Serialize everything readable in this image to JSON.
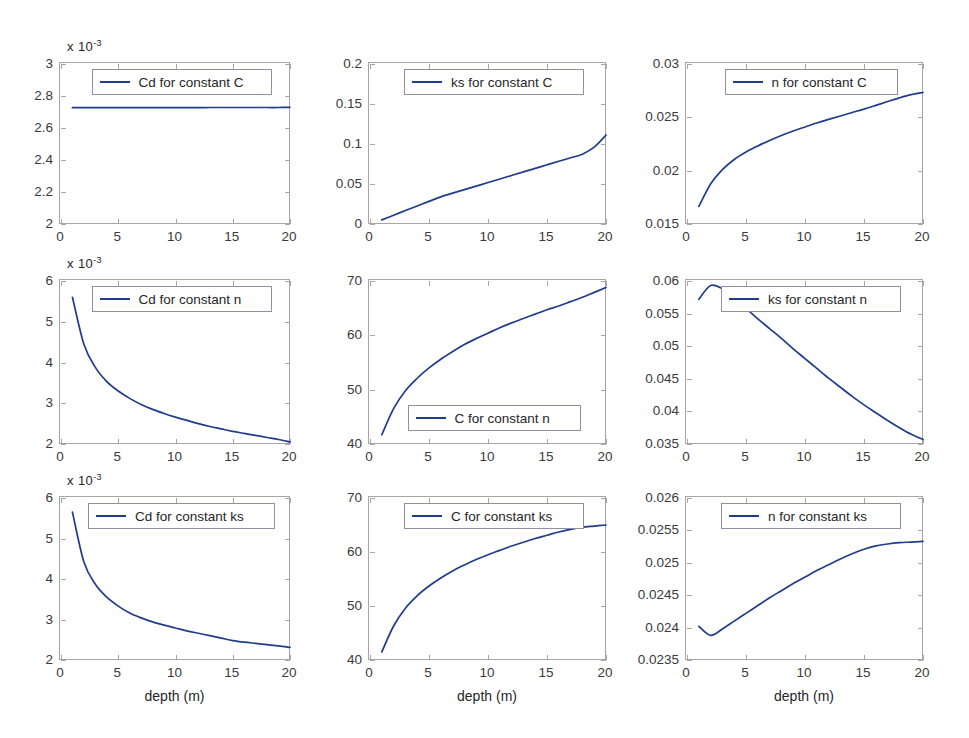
{
  "figure": {
    "width": 969,
    "height": 738,
    "background": "#ffffff",
    "line_color": "#203c8c",
    "axis_color": "#a6a6a6",
    "rows": 3,
    "cols": 3
  },
  "chart_data": [
    {
      "type": "line",
      "title": "",
      "legend": "Cd for constant C",
      "legend_position": "top-center",
      "xlabel": "",
      "ylabel": "",
      "exponent_label": "x 10",
      "exponent_power": "-3",
      "xlim": [
        0,
        20
      ],
      "ylim": [
        2,
        3
      ],
      "xticks": [
        "0",
        "5",
        "10",
        "15",
        "20"
      ],
      "xtick_values": [
        0,
        5,
        10,
        15,
        20
      ],
      "yticks": [
        "2",
        "2.2",
        "2.4",
        "2.6",
        "2.8",
        "3"
      ],
      "ytick_values": [
        2,
        2.2,
        2.4,
        2.6,
        2.8,
        3
      ],
      "grid": false,
      "x": [
        1,
        2,
        3,
        4,
        5,
        6,
        7,
        8,
        9,
        10,
        11,
        12,
        13,
        14,
        15,
        16,
        17,
        18,
        19,
        20
      ],
      "y": [
        2.727,
        2.727,
        2.727,
        2.727,
        2.727,
        2.727,
        2.727,
        2.727,
        2.727,
        2.727,
        2.727,
        2.727,
        2.728,
        2.728,
        2.728,
        2.728,
        2.728,
        2.728,
        2.728,
        2.729
      ]
    },
    {
      "type": "line",
      "title": "",
      "legend": "ks for constant C",
      "legend_position": "top-center",
      "xlabel": "",
      "ylabel": "",
      "exponent_label": "",
      "exponent_power": "",
      "xlim": [
        0,
        20
      ],
      "ylim": [
        0,
        0.2
      ],
      "xticks": [
        "0",
        "5",
        "10",
        "15",
        "20"
      ],
      "xtick_values": [
        0,
        5,
        10,
        15,
        20
      ],
      "yticks": [
        "0",
        "0.05",
        "0.1",
        "0.15",
        "0.2"
      ],
      "ytick_values": [
        0,
        0.05,
        0.1,
        0.15,
        0.2
      ],
      "grid": false,
      "x": [
        1,
        2,
        3,
        4,
        5,
        6,
        7,
        8,
        9,
        10,
        11,
        12,
        13,
        14,
        15,
        16,
        17,
        18,
        19,
        20
      ],
      "y": [
        0.0052,
        0.011,
        0.0168,
        0.0226,
        0.0283,
        0.0339,
        0.0386,
        0.043,
        0.0474,
        0.0518,
        0.0562,
        0.0607,
        0.0651,
        0.0695,
        0.074,
        0.0784,
        0.0828,
        0.0873,
        0.096,
        0.111
      ]
    },
    {
      "type": "line",
      "title": "",
      "legend": "n for constant C",
      "legend_position": "top-center",
      "xlabel": "",
      "ylabel": "",
      "exponent_label": "",
      "exponent_power": "",
      "xlim": [
        0,
        20
      ],
      "ylim": [
        0.015,
        0.03
      ],
      "xticks": [
        "0",
        "5",
        "10",
        "15",
        "20"
      ],
      "xtick_values": [
        0,
        5,
        10,
        15,
        20
      ],
      "yticks": [
        "0.015",
        "0.02",
        "0.025",
        "0.03"
      ],
      "ytick_values": [
        0.015,
        0.02,
        0.025,
        0.03
      ],
      "grid": false,
      "x": [
        1,
        2,
        3,
        4,
        5,
        6,
        7,
        8,
        9,
        10,
        11,
        12,
        13,
        14,
        15,
        16,
        17,
        18,
        19,
        20
      ],
      "y": [
        0.01665,
        0.01875,
        0.0201,
        0.02105,
        0.02175,
        0.02232,
        0.02283,
        0.0233,
        0.02372,
        0.0241,
        0.02447,
        0.02481,
        0.02513,
        0.02545,
        0.02577,
        0.02612,
        0.02648,
        0.02683,
        0.02713,
        0.02733
      ]
    },
    {
      "type": "line",
      "title": "",
      "legend": "Cd for constant n",
      "legend_position": "top-center",
      "xlabel": "",
      "ylabel": "",
      "exponent_label": "x 10",
      "exponent_power": "-3",
      "xlim": [
        0,
        20
      ],
      "ylim": [
        2,
        6
      ],
      "xticks": [
        "0",
        "5",
        "10",
        "15",
        "20"
      ],
      "xtick_values": [
        0,
        5,
        10,
        15,
        20
      ],
      "yticks": [
        "2",
        "3",
        "4",
        "5",
        "6"
      ],
      "ytick_values": [
        2,
        3,
        4,
        5,
        6
      ],
      "grid": false,
      "x": [
        1,
        2,
        3,
        4,
        5,
        6,
        7,
        8,
        9,
        10,
        11,
        12,
        13,
        14,
        15,
        16,
        17,
        18,
        19,
        20
      ],
      "y": [
        5.6,
        4.45,
        3.88,
        3.53,
        3.3,
        3.12,
        2.97,
        2.85,
        2.75,
        2.66,
        2.58,
        2.5,
        2.43,
        2.37,
        2.31,
        2.26,
        2.21,
        2.16,
        2.11,
        2.05
      ]
    },
    {
      "type": "line",
      "title": "",
      "legend": "C for constant n",
      "legend_position": "bottom-center",
      "xlabel": "",
      "ylabel": "",
      "exponent_label": "",
      "exponent_power": "",
      "xlim": [
        0,
        20
      ],
      "ylim": [
        40,
        70
      ],
      "xticks": [
        "0",
        "5",
        "10",
        "15",
        "20"
      ],
      "xtick_values": [
        0,
        5,
        10,
        15,
        20
      ],
      "yticks": [
        "40",
        "50",
        "60",
        "70"
      ],
      "ytick_values": [
        40,
        50,
        60,
        70
      ],
      "grid": false,
      "x": [
        1,
        2,
        3,
        4,
        5,
        6,
        7,
        8,
        9,
        10,
        11,
        12,
        13,
        14,
        15,
        16,
        17,
        18,
        19,
        20
      ],
      "y": [
        41.7,
        46.5,
        49.8,
        52.1,
        54.0,
        55.6,
        57.0,
        58.3,
        59.4,
        60.4,
        61.4,
        62.3,
        63.1,
        63.9,
        64.7,
        65.4,
        66.2,
        67.0,
        67.9,
        68.8
      ]
    },
    {
      "type": "line",
      "title": "",
      "legend": "ks for constant n",
      "legend_position": "top-center",
      "xlabel": "",
      "ylabel": "",
      "exponent_label": "",
      "exponent_power": "",
      "xlim": [
        0,
        20
      ],
      "ylim": [
        0.035,
        0.06
      ],
      "xticks": [
        "0",
        "5",
        "10",
        "15",
        "20"
      ],
      "xtick_values": [
        0,
        5,
        10,
        15,
        20
      ],
      "yticks": [
        "0.035",
        "0.04",
        "0.045",
        "0.05",
        "0.055",
        "0.06"
      ],
      "ytick_values": [
        0.035,
        0.04,
        0.045,
        0.05,
        0.055,
        0.06
      ],
      "grid": false,
      "x": [
        1,
        2,
        3,
        4,
        5,
        6,
        7,
        8,
        9,
        10,
        11,
        12,
        13,
        14,
        15,
        16,
        17,
        18,
        19,
        20
      ],
      "y": [
        0.0572,
        0.0593,
        0.0588,
        0.0573,
        0.0558,
        0.0542,
        0.0527,
        0.0512,
        0.0496,
        0.0481,
        0.0466,
        0.0451,
        0.0437,
        0.0423,
        0.041,
        0.0398,
        0.0386,
        0.0375,
        0.0365,
        0.0357
      ]
    },
    {
      "type": "line",
      "title": "",
      "legend": "Cd for constant ks",
      "legend_position": "top-center",
      "xlabel": "depth (m)",
      "ylabel": "",
      "exponent_label": "x 10",
      "exponent_power": "-3",
      "xlim": [
        0,
        20
      ],
      "ylim": [
        2,
        6
      ],
      "xticks": [
        "0",
        "5",
        "10",
        "15",
        "20"
      ],
      "xtick_values": [
        0,
        5,
        10,
        15,
        20
      ],
      "yticks": [
        "2",
        "3",
        "4",
        "5",
        "6"
      ],
      "ytick_values": [
        2,
        3,
        4,
        5,
        6
      ],
      "grid": false,
      "x": [
        1,
        2,
        3,
        4,
        5,
        6,
        7,
        8,
        9,
        10,
        11,
        12,
        13,
        14,
        15,
        16,
        17,
        18,
        19,
        20
      ],
      "y": [
        5.65,
        4.42,
        3.87,
        3.55,
        3.33,
        3.16,
        3.04,
        2.94,
        2.86,
        2.79,
        2.72,
        2.66,
        2.6,
        2.54,
        2.48,
        2.44,
        2.41,
        2.38,
        2.35,
        2.31
      ]
    },
    {
      "type": "line",
      "title": "",
      "legend": "C for constant ks",
      "legend_position": "top-center",
      "xlabel": "depth (m)",
      "ylabel": "",
      "exponent_label": "",
      "exponent_power": "",
      "xlim": [
        0,
        20
      ],
      "ylim": [
        40,
        70
      ],
      "xticks": [
        "0",
        "5",
        "10",
        "15",
        "20"
      ],
      "xtick_values": [
        0,
        5,
        10,
        15,
        20
      ],
      "yticks": [
        "40",
        "50",
        "60",
        "70"
      ],
      "ytick_values": [
        40,
        50,
        60,
        70
      ],
      "grid": false,
      "x": [
        1,
        2,
        3,
        4,
        5,
        6,
        7,
        8,
        9,
        10,
        11,
        12,
        13,
        14,
        15,
        16,
        17,
        18,
        19,
        20
      ],
      "y": [
        41.5,
        46.3,
        49.6,
        51.9,
        53.7,
        55.2,
        56.5,
        57.6,
        58.6,
        59.5,
        60.3,
        61.1,
        61.8,
        62.5,
        63.1,
        63.7,
        64.2,
        64.6,
        64.8,
        65.0
      ]
    },
    {
      "type": "line",
      "title": "",
      "legend": "n for constant ks",
      "legend_position": "top-center",
      "xlabel": "depth (m)",
      "ylabel": "",
      "exponent_label": "",
      "exponent_power": "",
      "xlim": [
        0,
        20
      ],
      "ylim": [
        0.0235,
        0.026
      ],
      "xticks": [
        "0",
        "5",
        "10",
        "15",
        "20"
      ],
      "xtick_values": [
        0,
        5,
        10,
        15,
        20
      ],
      "yticks": [
        "0.0235",
        "0.024",
        "0.0245",
        "0.025",
        "0.0255",
        "0.026"
      ],
      "ytick_values": [
        0.0235,
        0.024,
        0.0245,
        0.025,
        0.0255,
        0.026
      ],
      "grid": false,
      "x": [
        1,
        2,
        3,
        4,
        5,
        6,
        7,
        8,
        9,
        10,
        11,
        12,
        13,
        14,
        15,
        16,
        17,
        18,
        19,
        20
      ],
      "y": [
        0.02402,
        0.02388,
        0.02398,
        0.0241,
        0.02422,
        0.02434,
        0.02446,
        0.02457,
        0.02468,
        0.02478,
        0.02488,
        0.02497,
        0.02506,
        0.02514,
        0.02521,
        0.02526,
        0.02529,
        0.02531,
        0.02532,
        0.02533
      ]
    }
  ]
}
